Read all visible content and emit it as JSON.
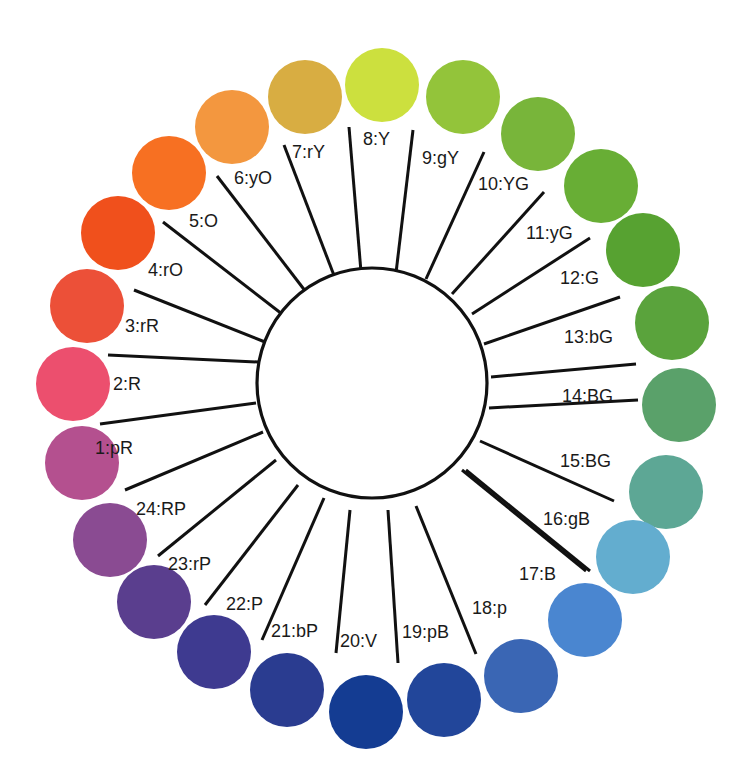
{
  "diagram": {
    "type": "color-wheel",
    "hub": {
      "cx": 372,
      "cy": 383,
      "r": 115
    },
    "dot_radius": 37,
    "hues": [
      {
        "id": 1,
        "label": "1:pR",
        "color": "#b4508f",
        "dot": [
          82,
          463
        ],
        "spoke": [
          [
            256,
            403
          ],
          [
            100,
            424
          ]
        ],
        "text": [
          95,
          454
        ]
      },
      {
        "id": 2,
        "label": "2:R",
        "color": "#ec4f6e",
        "dot": [
          73,
          384
        ],
        "spoke": [
          [
            258,
            362
          ],
          [
            108,
            355
          ]
        ],
        "text": [
          113,
          390
        ]
      },
      {
        "id": 3,
        "label": "3:rR",
        "color": "#ec5038",
        "dot": [
          87,
          306
        ],
        "spoke": [
          [
            265,
            342
          ],
          [
            134,
            290
          ]
        ],
        "text": [
          125,
          332
        ]
      },
      {
        "id": 4,
        "label": "4:rO",
        "color": "#f0501c",
        "dot": [
          118,
          233
        ],
        "spoke": [
          [
            282,
            314
          ],
          [
            163,
            222
          ]
        ],
        "text": [
          148,
          276
        ]
      },
      {
        "id": 5,
        "label": "5:O",
        "color": "#f77022",
        "dot": [
          169,
          173
        ],
        "spoke": [
          [
            306,
            292
          ],
          [
            217,
            176
          ]
        ],
        "text": [
          189,
          227
        ]
      },
      {
        "id": 6,
        "label": "6:yO",
        "color": "#f3973f",
        "dot": [
          232,
          127
        ],
        "spoke": [
          [
            335,
            278
          ],
          [
            284,
            145
          ]
        ],
        "text": [
          234,
          184
        ]
      },
      {
        "id": 7,
        "label": "7:rY",
        "color": "#d8ad42",
        "dot": [
          305,
          97
        ],
        "spoke": [
          [
            361,
            272
          ],
          [
            349,
            127
          ]
        ],
        "text": [
          292,
          158
        ]
      },
      {
        "id": 8,
        "label": "8:Y",
        "color": "#cce03e",
        "dot": [
          382,
          85
        ],
        "spoke": [
          [
            396,
            273
          ],
          [
            413,
            130
          ]
        ],
        "text": [
          363,
          145
        ]
      },
      {
        "id": 9,
        "label": "9:gY",
        "color": "#93c43a",
        "dot": [
          463,
          97
        ],
        "spoke": [
          [
            426,
            279
          ],
          [
            484,
            152
          ]
        ],
        "text": [
          422,
          164
        ]
      },
      {
        "id": 10,
        "label": "10:YG",
        "color": "#78b53a",
        "dot": [
          538,
          134
        ],
        "spoke": [
          [
            452,
            294
          ],
          [
            544,
            192
          ]
        ],
        "text": [
          478,
          190
        ]
      },
      {
        "id": 11,
        "label": "11:yG",
        "color": "#68ae35",
        "dot": [
          601,
          186
        ],
        "spoke": [
          [
            472,
            314
          ],
          [
            590,
            238
          ]
        ],
        "text": [
          526,
          239
        ]
      },
      {
        "id": 12,
        "label": "12:G",
        "color": "#57a231",
        "dot": [
          643,
          250
        ],
        "spoke": [
          [
            484,
            344
          ],
          [
            620,
            297
          ]
        ],
        "text": [
          560,
          284
        ]
      },
      {
        "id": 13,
        "label": "13:bG",
        "color": "#5aa33c",
        "dot": [
          672,
          323
        ],
        "spoke": [
          [
            491,
            377
          ],
          [
            636,
            364
          ]
        ],
        "text": [
          564,
          343
        ]
      },
      {
        "id": 14,
        "label": "14:BG",
        "color": "#5aa16a",
        "dot": [
          679,
          405
        ],
        "spoke": null,
        "text": [
          562,
          402
        ]
      },
      {
        "id": 15,
        "label": "15:BG",
        "color": "#5da795",
        "dot": [
          666,
          492
        ],
        "spoke": [
          [
            480,
            441
          ],
          [
            614,
            501
          ]
        ],
        "text": [
          560,
          467
        ]
      },
      {
        "id": 16,
        "label": "16:gB",
        "color": "#63adcf",
        "dot": [
          633,
          557
        ],
        "spoke": [
          [
            462,
            470
          ],
          [
            586,
            571
          ]
        ],
        "text": [
          543,
          525
        ]
      },
      {
        "id": 17,
        "label": "17:B",
        "color": "#4a86d0",
        "dot": [
          585,
          620
        ],
        "spoke": null,
        "text": [
          519,
          580
        ]
      },
      {
        "id": 18,
        "label": "18:p",
        "color": "#3a66b4",
        "dot": [
          521,
          676
        ],
        "spoke": [
          [
            416,
            506
          ],
          [
            476,
            654
          ]
        ],
        "text": [
          472,
          614
        ]
      },
      {
        "id": 19,
        "label": "19:pB",
        "color": "#22469a",
        "dot": [
          444,
          700
        ],
        "spoke": [
          [
            388,
            510
          ],
          [
            398,
            663
          ]
        ],
        "text": [
          402,
          638
        ]
      },
      {
        "id": 20,
        "label": "20:V",
        "color": "#143c92",
        "dot": [
          366,
          712
        ],
        "spoke": [
          [
            350,
            510
          ],
          [
            336,
            653
          ]
        ],
        "text": [
          340,
          647
        ]
      },
      {
        "id": 21,
        "label": "21:bP",
        "color": "#2a3c90",
        "dot": [
          287,
          690
        ],
        "spoke": [
          [
            324,
            498
          ],
          [
            262,
            640
          ]
        ],
        "text": [
          271,
          637
        ]
      },
      {
        "id": 22,
        "label": "22:P",
        "color": "#3e3a90",
        "dot": [
          214,
          652
        ],
        "spoke": [
          [
            298,
            485
          ],
          [
            205,
            605
          ]
        ],
        "text": [
          226,
          610
        ]
      },
      {
        "id": 23,
        "label": "23:rP",
        "color": "#5a3e8e",
        "dot": [
          154,
          602
        ],
        "spoke": [
          [
            276,
            460
          ],
          [
            158,
            556
          ]
        ],
        "text": [
          168,
          570
        ]
      },
      {
        "id": 24,
        "label": "24:RP",
        "color": "#8a4b92",
        "dot": [
          110,
          540
        ],
        "spoke": [
          [
            263,
            432
          ],
          [
            125,
            490
          ]
        ],
        "text": [
          136,
          515
        ]
      }
    ],
    "extra_spokes": [
      [
        [
          489,
          408
        ],
        [
          638,
          400
        ]
      ],
      [
        [
          466,
          470
        ],
        [
          590,
          571
        ]
      ]
    ]
  }
}
